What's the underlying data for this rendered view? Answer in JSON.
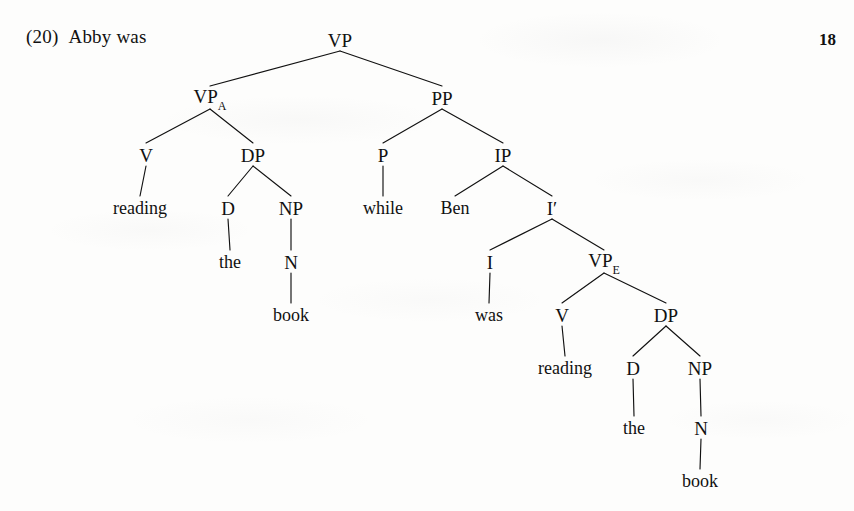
{
  "page": {
    "page_number": "18",
    "background_color": "#fdfdfc",
    "ink_color": "#111111"
  },
  "example": {
    "number": "(20)",
    "prefix_text": "Abby was"
  },
  "tree": {
    "type": "syntax-tree",
    "sentence": "Abby was reading the book while Ben was reading the book",
    "nodes": [
      {
        "id": "vp-root",
        "label": "VP",
        "sub": "",
        "x": 340,
        "y": 40,
        "kind": "category"
      },
      {
        "id": "vp-a",
        "label": "VP",
        "sub": "A",
        "x": 210,
        "y": 98,
        "kind": "category"
      },
      {
        "id": "pp",
        "label": "PP",
        "sub": "",
        "x": 442,
        "y": 98,
        "kind": "category"
      },
      {
        "id": "v-left",
        "label": "V",
        "sub": "",
        "x": 146,
        "y": 155,
        "kind": "category"
      },
      {
        "id": "dp-left",
        "label": "DP",
        "sub": "",
        "x": 253,
        "y": 155,
        "kind": "category"
      },
      {
        "id": "p",
        "label": "P",
        "sub": "",
        "x": 383,
        "y": 155,
        "kind": "category"
      },
      {
        "id": "ip",
        "label": "IP",
        "sub": "",
        "x": 503,
        "y": 155,
        "kind": "category"
      },
      {
        "id": "word-reading-1",
        "label": "reading",
        "sub": "",
        "x": 140,
        "y": 208,
        "kind": "word"
      },
      {
        "id": "d-left",
        "label": "D",
        "sub": "",
        "x": 228,
        "y": 208,
        "kind": "category"
      },
      {
        "id": "np-left",
        "label": "NP",
        "sub": "",
        "x": 291,
        "y": 208,
        "kind": "category"
      },
      {
        "id": "word-while",
        "label": "while",
        "sub": "",
        "x": 383,
        "y": 208,
        "kind": "word"
      },
      {
        "id": "word-ben",
        "label": "Ben",
        "sub": "",
        "x": 455,
        "y": 208,
        "kind": "word"
      },
      {
        "id": "i-bar",
        "label": "I′",
        "sub": "",
        "x": 552,
        "y": 208,
        "kind": "category"
      },
      {
        "id": "word-the-1",
        "label": "the",
        "sub": "",
        "x": 230,
        "y": 262,
        "kind": "word"
      },
      {
        "id": "n-left",
        "label": "N",
        "sub": "",
        "x": 291,
        "y": 262,
        "kind": "category"
      },
      {
        "id": "i",
        "label": "I",
        "sub": "",
        "x": 490,
        "y": 262,
        "kind": "category"
      },
      {
        "id": "vp-e",
        "label": "VP",
        "sub": "E",
        "x": 604,
        "y": 262,
        "kind": "category"
      },
      {
        "id": "word-book-1",
        "label": "book",
        "sub": "",
        "x": 291,
        "y": 315,
        "kind": "word"
      },
      {
        "id": "word-was",
        "label": "was",
        "sub": "",
        "x": 489,
        "y": 315,
        "kind": "word"
      },
      {
        "id": "v-right",
        "label": "V",
        "sub": "",
        "x": 562,
        "y": 315,
        "kind": "category"
      },
      {
        "id": "dp-right",
        "label": "DP",
        "sub": "",
        "x": 666,
        "y": 315,
        "kind": "category"
      },
      {
        "id": "word-reading-2",
        "label": "reading",
        "sub": "",
        "x": 565,
        "y": 368,
        "kind": "word"
      },
      {
        "id": "d-right",
        "label": "D",
        "sub": "",
        "x": 633,
        "y": 368,
        "kind": "category"
      },
      {
        "id": "np-right",
        "label": "NP",
        "sub": "",
        "x": 700,
        "y": 368,
        "kind": "category"
      },
      {
        "id": "word-the-2",
        "label": "the",
        "sub": "",
        "x": 634,
        "y": 428,
        "kind": "word"
      },
      {
        "id": "n-right",
        "label": "N",
        "sub": "",
        "x": 701,
        "y": 428,
        "kind": "category"
      },
      {
        "id": "word-book-2",
        "label": "book",
        "sub": "",
        "x": 700,
        "y": 481,
        "kind": "word"
      }
    ],
    "edges": [
      {
        "from": "vp-root",
        "to": "vp-a"
      },
      {
        "from": "vp-root",
        "to": "pp"
      },
      {
        "from": "vp-a",
        "to": "v-left"
      },
      {
        "from": "vp-a",
        "to": "dp-left"
      },
      {
        "from": "v-left",
        "to": "word-reading-1"
      },
      {
        "from": "dp-left",
        "to": "d-left"
      },
      {
        "from": "dp-left",
        "to": "np-left"
      },
      {
        "from": "d-left",
        "to": "word-the-1"
      },
      {
        "from": "np-left",
        "to": "n-left"
      },
      {
        "from": "n-left",
        "to": "word-book-1"
      },
      {
        "from": "pp",
        "to": "p"
      },
      {
        "from": "pp",
        "to": "ip"
      },
      {
        "from": "p",
        "to": "word-while"
      },
      {
        "from": "ip",
        "to": "word-ben"
      },
      {
        "from": "ip",
        "to": "i-bar"
      },
      {
        "from": "i-bar",
        "to": "i"
      },
      {
        "from": "i-bar",
        "to": "vp-e"
      },
      {
        "from": "i",
        "to": "word-was"
      },
      {
        "from": "vp-e",
        "to": "v-right"
      },
      {
        "from": "vp-e",
        "to": "dp-right"
      },
      {
        "from": "v-right",
        "to": "word-reading-2"
      },
      {
        "from": "dp-right",
        "to": "d-right"
      },
      {
        "from": "dp-right",
        "to": "np-right"
      },
      {
        "from": "d-right",
        "to": "word-the-2"
      },
      {
        "from": "np-right",
        "to": "n-right"
      },
      {
        "from": "n-right",
        "to": "word-book-2"
      }
    ]
  }
}
